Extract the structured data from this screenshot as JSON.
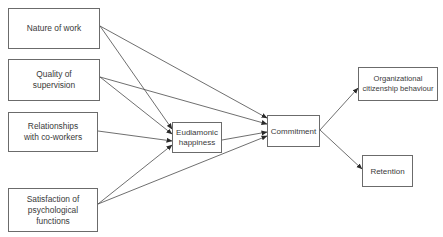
{
  "diagram": {
    "type": "path-model",
    "nodes": {
      "nature_of_work": "Nature of work",
      "quality_of_supervision": "Quality of\nsupervision",
      "relationships": "Relationships\nwith co-workers",
      "satisfaction": "Satisfaction of\npsychological\nfunctions",
      "eudaimonic": "Eudiamonic\nhappiness",
      "commitment": "Commitment",
      "ocb": "Organizational\ncitizenship behaviour",
      "retention": "Retention"
    },
    "edges": [
      {
        "from": "nature_of_work",
        "to": "eudaimonic"
      },
      {
        "from": "nature_of_work",
        "to": "commitment"
      },
      {
        "from": "quality_of_supervision",
        "to": "eudaimonic"
      },
      {
        "from": "quality_of_supervision",
        "to": "commitment"
      },
      {
        "from": "relationships",
        "to": "eudaimonic"
      },
      {
        "from": "satisfaction",
        "to": "eudaimonic"
      },
      {
        "from": "satisfaction",
        "to": "commitment"
      },
      {
        "from": "eudaimonic",
        "to": "commitment"
      },
      {
        "from": "commitment",
        "to": "ocb"
      },
      {
        "from": "commitment",
        "to": "retention"
      }
    ],
    "colors": {
      "line": "#4a4a4a",
      "border": "#6b6b6b",
      "text": "#3a3a3a"
    }
  }
}
